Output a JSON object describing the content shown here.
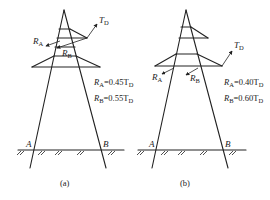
{
  "figure": {
    "panels": [
      {
        "id": "a",
        "caption": "(a)",
        "force_labels": {
          "TD": "T",
          "TD_sub": "D",
          "RA": "R",
          "RA_sub": "A",
          "RB": "R",
          "RB_sub": "B"
        },
        "equations": [
          {
            "lhs": "R",
            "lhs_sub": "A",
            "rhs": "=0.45T",
            "rhs_sub": "D"
          },
          {
            "lhs": "R",
            "lhs_sub": "B",
            "rhs": "=0.55T",
            "rhs_sub": "D"
          }
        ],
        "support_labels": {
          "left": "A",
          "right": "B"
        }
      },
      {
        "id": "b",
        "caption": "(b)",
        "force_labels": {
          "TD": "T",
          "TD_sub": "D",
          "RA": "R",
          "RA_sub": "A",
          "RB": "R",
          "RB_sub": "B"
        },
        "equations": [
          {
            "lhs": "R",
            "lhs_sub": "A",
            "rhs": "=0.40T",
            "rhs_sub": "D"
          },
          {
            "lhs": "R",
            "lhs_sub": "B",
            "rhs": "=0.60T",
            "rhs_sub": "D"
          }
        ],
        "support_labels": {
          "left": "A",
          "right": "B"
        }
      }
    ]
  }
}
